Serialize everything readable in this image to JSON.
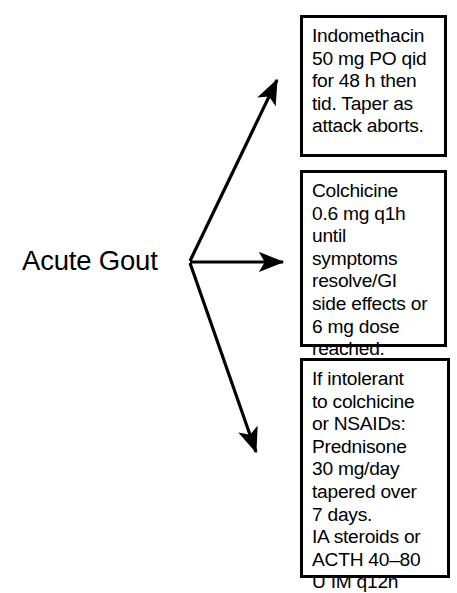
{
  "diagram": {
    "type": "flowchart",
    "background_color": "#ffffff",
    "stroke_color": "#000000",
    "root": {
      "label": "Acute Gout"
    },
    "branches": [
      {
        "id": "indomethacin",
        "arrow": "up-right",
        "lines": [
          "Indomethacin",
          "50 mg PO qid",
          "for 48 h then",
          "tid. Taper as",
          "attack aborts."
        ]
      },
      {
        "id": "colchicine",
        "arrow": "right",
        "lines": [
          "Colchicine",
          "0.6 mg q1h",
          "until",
          "symptoms",
          "resolve/GI",
          "side effects or",
          "6 mg dose",
          "reached."
        ]
      },
      {
        "id": "steroids",
        "arrow": "down-right",
        "lines": [
          "If intolerant",
          "to colchicine",
          "or NSAIDs:",
          "Prednisone",
          "30 mg/day",
          "tapered over",
          "7 days.",
          "IA steroids or",
          "ACTH 40–80",
          "U IM q12h"
        ]
      }
    ]
  }
}
